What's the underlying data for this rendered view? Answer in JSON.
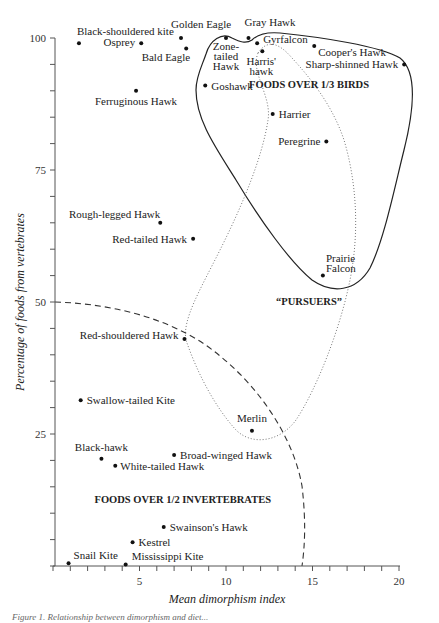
{
  "chart_data": {
    "type": "scatter",
    "title": "",
    "xlabel": "Mean dimorphism index",
    "ylabel": "Percentage of foods from vertebrates",
    "xlim": [
      0,
      20
    ],
    "ylim": [
      0,
      100
    ],
    "x_ticks": [
      5,
      10,
      15,
      20
    ],
    "y_ticks": [
      25,
      50,
      75,
      100
    ],
    "grid": false,
    "points": [
      {
        "name": "Black-shouldered kite",
        "x": 1.5,
        "y": 99,
        "lx": -2,
        "ly": -8,
        "anchor": "start"
      },
      {
        "name": "Osprey",
        "x": 5.1,
        "y": 99,
        "lx": -6,
        "ly": 3,
        "anchor": "end"
      },
      {
        "name": "Golden Eagle",
        "x": 7.4,
        "y": 100,
        "lx": -10,
        "ly": -10,
        "anchor": "start"
      },
      {
        "name": "Bald Eagle",
        "x": 7.7,
        "y": 98,
        "lx": 4,
        "ly": 12,
        "anchor": "end"
      },
      {
        "name": "Ferruginous Hawk",
        "x": 4.8,
        "y": 90,
        "lx": 0,
        "ly": 14,
        "anchor": "middle"
      },
      {
        "name": "Zone-tailed Hawk",
        "x": 10.0,
        "y": 100,
        "lines": [
          "Zone-",
          "tailed",
          "Hawk"
        ],
        "lx": 0,
        "ly": 12,
        "anchor": "middle"
      },
      {
        "name": "Gray Hawk",
        "x": 11.3,
        "y": 100,
        "lx": -4,
        "ly": -12,
        "anchor": "start"
      },
      {
        "name": "Gyrfalcon",
        "x": 11.8,
        "y": 99,
        "lx": 6,
        "ly": 0,
        "anchor": "start"
      },
      {
        "name": "Harris' hawk",
        "x": 12.1,
        "y": 97.5,
        "lines": [
          "Harris'",
          "hawk"
        ],
        "lx": -1,
        "ly": 14,
        "anchor": "middle"
      },
      {
        "name": "Goshawk",
        "x": 8.8,
        "y": 91,
        "lx": 6,
        "ly": 4,
        "anchor": "start"
      },
      {
        "name": "Cooper's Hawk",
        "x": 15.1,
        "y": 98.5,
        "lx": 4,
        "ly": 10,
        "anchor": "start"
      },
      {
        "name": "Sharp-shinned Hawk",
        "x": 20.3,
        "y": 95,
        "lx": -6,
        "ly": 4,
        "anchor": "end"
      },
      {
        "name": "Harrier",
        "x": 12.7,
        "y": 85.6,
        "lx": 6,
        "ly": 4,
        "anchor": "start"
      },
      {
        "name": "Peregrine",
        "x": 15.8,
        "y": 80.4,
        "lx": -6,
        "ly": 4,
        "anchor": "end"
      },
      {
        "name": "Prairie Falcon",
        "x": 15.6,
        "y": 55,
        "lines": [
          "Prairie",
          "Falcon"
        ],
        "lx": 3,
        "ly": -14,
        "anchor": "start"
      },
      {
        "name": "Rough-legged Hawk",
        "x": 6.2,
        "y": 65,
        "lx": 0,
        "ly": -5,
        "anchor": "end"
      },
      {
        "name": "Red-tailed Hawk",
        "x": 8.1,
        "y": 62,
        "lx": -6,
        "ly": 4,
        "anchor": "end"
      },
      {
        "name": "Red-shouldered Hawk",
        "x": 7.6,
        "y": 43,
        "lx": -6,
        "ly": 0,
        "anchor": "end"
      },
      {
        "name": "Swallow-tailed Kite",
        "x": 1.6,
        "y": 31.4,
        "lx": 6,
        "ly": 4,
        "anchor": "start"
      },
      {
        "name": "Merlin",
        "x": 11.5,
        "y": 25.6,
        "lx": 0,
        "ly": -9,
        "anchor": "middle"
      },
      {
        "name": "Black-hawk",
        "x": 2.8,
        "y": 20.3,
        "lx": 0,
        "ly": -8,
        "anchor": "middle"
      },
      {
        "name": "White-tailed Hawk",
        "x": 3.6,
        "y": 19,
        "lx": 5,
        "ly": 4,
        "anchor": "start"
      },
      {
        "name": "Broad-winged Hawk",
        "x": 7.0,
        "y": 21,
        "lx": 6,
        "ly": 4,
        "anchor": "start"
      },
      {
        "name": "Swainson's Hawk",
        "x": 6.4,
        "y": 7.4,
        "lx": 6,
        "ly": 4,
        "anchor": "start"
      },
      {
        "name": "Kestrel",
        "x": 4.6,
        "y": 4.5,
        "lx": 6,
        "ly": 4,
        "anchor": "start"
      },
      {
        "name": "Snail Kite",
        "x": 0.9,
        "y": 0.5,
        "lx": 5,
        "ly": -4,
        "anchor": "start"
      },
      {
        "name": "Mississippi Kite",
        "x": 4.2,
        "y": 0.3,
        "lx": 6,
        "ly": -4,
        "anchor": "start"
      }
    ],
    "regions": [
      {
        "name": "FOODS OVER 1/3 BIRDS",
        "style": "solid",
        "label_x": 14.8,
        "label_y": 90.5
      },
      {
        "name": "“PURSUERS”",
        "style": "dotted",
        "label_x": 14.8,
        "label_y": 49.5
      },
      {
        "name": "FOODS OVER 1/2 INVERTEBRATES",
        "style": "dashed",
        "label_x": 7.5,
        "label_y": 12
      }
    ]
  },
  "caption": "Figure 1. Relationship between dimorphism and diet..."
}
